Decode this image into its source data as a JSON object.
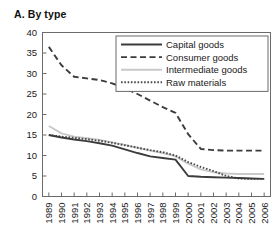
{
  "panel": {
    "title": "A. By type"
  },
  "chart_data": {
    "type": "line",
    "title": "A. By type",
    "xlabel": "",
    "ylabel": "",
    "ylim": [
      0,
      40
    ],
    "yticks": [
      0,
      5,
      10,
      15,
      20,
      25,
      30,
      35,
      40
    ],
    "grid": false,
    "legend_position": "top-right",
    "categories": [
      "1989",
      "1990",
      "1991",
      "1992",
      "1993",
      "1994",
      "1995",
      "1996",
      "1997",
      "1998",
      "1999",
      "2000",
      "2001",
      "2002",
      "2003",
      "2004",
      "2005",
      "2006"
    ],
    "series": [
      {
        "name": "Capital goods",
        "style": "solid",
        "color": "#3c3c3c",
        "values": [
          15.0,
          14.4,
          13.9,
          13.5,
          13.0,
          12.4,
          11.5,
          10.6,
          9.8,
          9.4,
          9.0,
          5.0,
          4.8,
          4.7,
          4.6,
          4.5,
          4.4,
          4.3
        ]
      },
      {
        "name": "Consumer goods",
        "style": "dashed",
        "color": "#3c3c3c",
        "values": [
          36.5,
          32.0,
          29.2,
          28.8,
          28.4,
          27.6,
          26.4,
          25.0,
          23.4,
          21.8,
          20.4,
          15.2,
          11.6,
          11.3,
          11.2,
          11.2,
          11.2,
          11.2
        ]
      },
      {
        "name": "Intermediate goods",
        "style": "solid-light",
        "color": "#c9c9c9",
        "values": [
          17.2,
          15.4,
          14.6,
          14.2,
          13.8,
          13.2,
          12.6,
          11.9,
          11.2,
          10.6,
          9.8,
          8.0,
          6.6,
          5.9,
          5.6,
          5.5,
          5.5,
          5.5
        ]
      },
      {
        "name": "Raw materials",
        "style": "dotted",
        "color": "#4a4a4a",
        "values": [
          15.0,
          14.6,
          14.3,
          14.0,
          13.6,
          13.1,
          12.5,
          11.9,
          11.3,
          10.8,
          10.0,
          8.4,
          7.2,
          6.2,
          5.0,
          4.4,
          4.3,
          4.3
        ]
      }
    ]
  }
}
